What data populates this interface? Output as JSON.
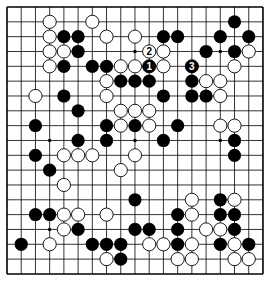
{
  "board": {
    "size": 19,
    "origin": {
      "x": 7,
      "y": 7
    },
    "spacing": {
      "x": 14.22,
      "y": 14.83
    },
    "stone_radius": 6.6,
    "colors": {
      "line": "#000000",
      "black_stone": "#000000",
      "white_stone": "#ffffff",
      "stone_outline": "#000000",
      "background": "#ffffff"
    },
    "star_points": [
      [
        3,
        3
      ],
      [
        3,
        9
      ],
      [
        3,
        15
      ],
      [
        9,
        3
      ],
      [
        9,
        9
      ],
      [
        9,
        15
      ],
      [
        15,
        3
      ],
      [
        15,
        9
      ],
      [
        15,
        15
      ]
    ],
    "black": [
      [
        16,
        1
      ],
      [
        4,
        2
      ],
      [
        5,
        2
      ],
      [
        11,
        2
      ],
      [
        12,
        2
      ],
      [
        15,
        2
      ],
      [
        17,
        2
      ],
      [
        5,
        3
      ],
      [
        14,
        3
      ],
      [
        16,
        3
      ],
      [
        4,
        4
      ],
      [
        6,
        4
      ],
      [
        7,
        4
      ],
      [
        8,
        5
      ],
      [
        9,
        5
      ],
      [
        10,
        5
      ],
      [
        13,
        5
      ],
      [
        4,
        6
      ],
      [
        11,
        6
      ],
      [
        13,
        6
      ],
      [
        14,
        6
      ],
      [
        5,
        7
      ],
      [
        2,
        8
      ],
      [
        7,
        8
      ],
      [
        9,
        8
      ],
      [
        12,
        8
      ],
      [
        5,
        9
      ],
      [
        7,
        9
      ],
      [
        11,
        9
      ],
      [
        16,
        9
      ],
      [
        2,
        10
      ],
      [
        16,
        10
      ],
      [
        3,
        11
      ],
      [
        9,
        13
      ],
      [
        15,
        13
      ],
      [
        2,
        14
      ],
      [
        3,
        14
      ],
      [
        12,
        14
      ],
      [
        15,
        14
      ],
      [
        16,
        14
      ],
      [
        5,
        15
      ],
      [
        9,
        15
      ],
      [
        10,
        15
      ],
      [
        12,
        15
      ],
      [
        16,
        15
      ],
      [
        1,
        16
      ],
      [
        6,
        16
      ],
      [
        7,
        16
      ],
      [
        8,
        16
      ],
      [
        12,
        16
      ],
      [
        15,
        16
      ],
      [
        17,
        16
      ],
      [
        8,
        17
      ]
    ],
    "white": [
      [
        3,
        1
      ],
      [
        6,
        1
      ],
      [
        3,
        2
      ],
      [
        7,
        2
      ],
      [
        9,
        2
      ],
      [
        3,
        3
      ],
      [
        4,
        3
      ],
      [
        11,
        3
      ],
      [
        17,
        3
      ],
      [
        3,
        4
      ],
      [
        8,
        4
      ],
      [
        9,
        4
      ],
      [
        11,
        4
      ],
      [
        16,
        4
      ],
      [
        7,
        5
      ],
      [
        14,
        5
      ],
      [
        15,
        5
      ],
      [
        2,
        6
      ],
      [
        7,
        6
      ],
      [
        15,
        6
      ],
      [
        8,
        7
      ],
      [
        9,
        7
      ],
      [
        10,
        7
      ],
      [
        8,
        8
      ],
      [
        10,
        8
      ],
      [
        15,
        8
      ],
      [
        16,
        8
      ],
      [
        4,
        10
      ],
      [
        5,
        10
      ],
      [
        6,
        10
      ],
      [
        9,
        10
      ],
      [
        8,
        11
      ],
      [
        4,
        12
      ],
      [
        13,
        13
      ],
      [
        16,
        13
      ],
      [
        4,
        14
      ],
      [
        5,
        14
      ],
      [
        7,
        14
      ],
      [
        13,
        14
      ],
      [
        4,
        15
      ],
      [
        14,
        15
      ],
      [
        15,
        15
      ],
      [
        3,
        16
      ],
      [
        10,
        16
      ],
      [
        11,
        16
      ],
      [
        13,
        16
      ],
      [
        16,
        16
      ],
      [
        7,
        17
      ],
      [
        12,
        17
      ],
      [
        13,
        17
      ],
      [
        16,
        17
      ],
      [
        17,
        17
      ]
    ],
    "numbered_moves": [
      {
        "number": "1",
        "color": "black",
        "x": 10,
        "y": 4
      },
      {
        "number": "2",
        "color": "white",
        "x": 10,
        "y": 3
      },
      {
        "number": "3",
        "color": "black",
        "x": 13,
        "y": 4
      }
    ]
  }
}
